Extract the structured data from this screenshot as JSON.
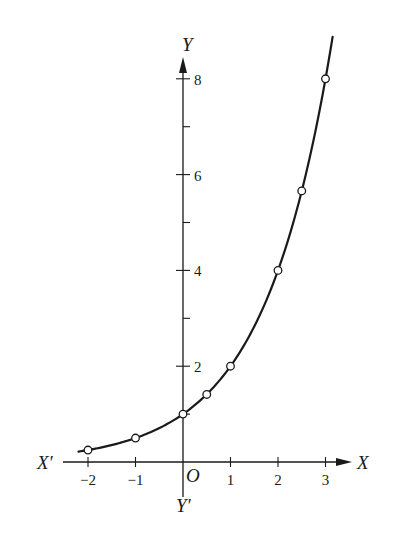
{
  "chart_data": {
    "type": "line",
    "title": "",
    "function": "y = 2^x",
    "xlabel": "X",
    "xlabel_neg": "X′",
    "ylabel": "Y",
    "ylabel_neg": "Y′",
    "origin_label": "O",
    "xlim": [
      -2.5,
      3.5
    ],
    "ylim": [
      -0.75,
      8.5
    ],
    "grid": false,
    "legend": null,
    "x_ticks": [
      -2,
      -1,
      1,
      2,
      3
    ],
    "x_tick_labels": [
      "−2",
      "−1",
      "1",
      "2",
      "3"
    ],
    "y_ticks_labeled": [
      2,
      4,
      6,
      8
    ],
    "y_tick_labels": [
      "2",
      "4",
      "6",
      "8"
    ],
    "y_ticks_minor": [
      1,
      3,
      5,
      7
    ],
    "series": [
      {
        "name": "y = 2^x",
        "curve_x_range": [
          -2.2,
          3.15
        ],
        "points": [
          {
            "x": -2,
            "y": 0.25
          },
          {
            "x": -1,
            "y": 0.5
          },
          {
            "x": 0,
            "y": 1
          },
          {
            "x": 0.5,
            "y": 1.41
          },
          {
            "x": 1,
            "y": 2
          },
          {
            "x": 2,
            "y": 4
          },
          {
            "x": 2.5,
            "y": 5.66
          },
          {
            "x": 3,
            "y": 8
          }
        ],
        "marker": "open-circle",
        "color": "#1a1a1a"
      }
    ]
  }
}
